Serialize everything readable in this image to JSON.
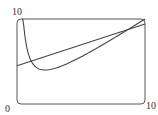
{
  "chart_data": {
    "type": "line",
    "title": "",
    "xlabel": "",
    "ylabel": "",
    "xlim": [
      0,
      10
    ],
    "ylim": [
      0,
      10
    ],
    "grid": false,
    "legend": "none",
    "tick_labels": {
      "origin": "0",
      "x_max": "10",
      "y_max": "10"
    },
    "series": [
      {
        "name": "curve",
        "kind": "function",
        "description": "convex curve decreasing steeply from top-left, minimum near (2.2, 4.0), rising to (10, 10)",
        "x": [
          0.45,
          0.6,
          0.8,
          1.0,
          1.3,
          1.6,
          2.0,
          2.2,
          2.6,
          3.0,
          4.0,
          5.0,
          6.0,
          7.0,
          8.0,
          9.0,
          10.0
        ],
        "y": [
          10.0,
          8.2,
          6.6,
          5.4,
          4.6,
          4.2,
          4.03,
          4.0,
          4.04,
          4.2,
          4.8,
          5.5,
          6.3,
          7.2,
          8.1,
          9.0,
          10.0
        ]
      },
      {
        "name": "line",
        "kind": "linear",
        "x": [
          0,
          10
        ],
        "y": [
          4.5,
          9.4
        ]
      }
    ],
    "colors": {
      "axes": "#555555",
      "curve": "#444444",
      "line": "#444444"
    }
  }
}
